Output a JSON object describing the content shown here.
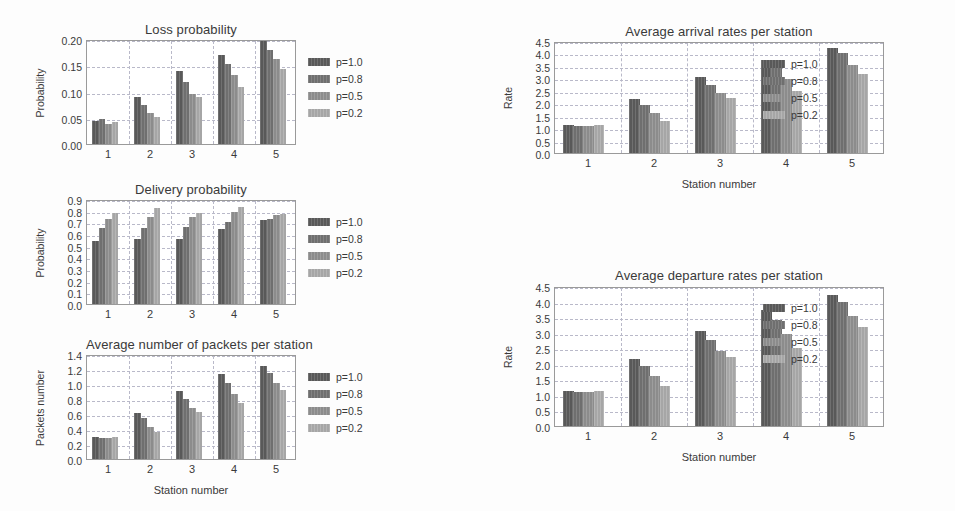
{
  "figure": {
    "series_labels": [
      "p=1.0",
      "p=0.8",
      "p=0.5",
      "p=0.2"
    ],
    "series_colors": [
      "#595959",
      "#6f6f6f",
      "#8c8c8c",
      "#a6a6a6"
    ],
    "background": "#ffffff",
    "grid_color": "#b9b9c9"
  },
  "chart_data": [
    {
      "id": "loss-probability",
      "type": "bar",
      "title": "Loss probability",
      "xlabel": "",
      "ylabel": "Probability",
      "categories": [
        "1",
        "2",
        "3",
        "4",
        "5"
      ],
      "ylim": [
        0.0,
        0.2
      ],
      "yticks": [
        0.0,
        0.05,
        0.1,
        0.15,
        0.2
      ],
      "ytick_labels": [
        "0.00",
        "0.05",
        "0.10",
        "0.15",
        "0.20"
      ],
      "grid": true,
      "legend_position": "right-outside-top",
      "series": [
        {
          "name": "p=1.0",
          "values": [
            0.043,
            0.089,
            0.139,
            0.17,
            0.197
          ]
        },
        {
          "name": "p=0.8",
          "values": [
            0.048,
            0.075,
            0.119,
            0.153,
            0.18
          ]
        },
        {
          "name": "p=0.5",
          "values": [
            0.038,
            0.06,
            0.096,
            0.131,
            0.161
          ]
        },
        {
          "name": "p=0.2",
          "values": [
            0.042,
            0.052,
            0.09,
            0.108,
            0.143
          ]
        }
      ]
    },
    {
      "id": "delivery-probability",
      "type": "bar",
      "title": "Delivery probability",
      "xlabel": "",
      "ylabel": "Probability",
      "categories": [
        "1",
        "2",
        "3",
        "4",
        "5"
      ],
      "ylim": [
        0.0,
        0.9
      ],
      "yticks": [
        0.0,
        0.1,
        0.2,
        0.3,
        0.4,
        0.5,
        0.6,
        0.7,
        0.8,
        0.9
      ],
      "ytick_labels": [
        "0.0",
        "0.1",
        "0.2",
        "0.3",
        "0.4",
        "0.5",
        "0.6",
        "0.7",
        "0.8",
        "0.9"
      ],
      "grid": true,
      "legend_position": "right-outside-top",
      "series": [
        {
          "name": "p=1.0",
          "values": [
            0.54,
            0.56,
            0.56,
            0.64,
            0.72
          ]
        },
        {
          "name": "p=0.8",
          "values": [
            0.65,
            0.65,
            0.66,
            0.7,
            0.73
          ]
        },
        {
          "name": "p=0.5",
          "values": [
            0.73,
            0.75,
            0.75,
            0.79,
            0.76
          ]
        },
        {
          "name": "p=0.2",
          "values": [
            0.78,
            0.82,
            0.78,
            0.83,
            0.77
          ]
        }
      ]
    },
    {
      "id": "average-packets-per-station",
      "type": "bar",
      "title": "Average number of packets per station",
      "xlabel": "Station number",
      "ylabel": "Packets number",
      "categories": [
        "1",
        "2",
        "3",
        "4",
        "5"
      ],
      "ylim": [
        0.0,
        1.4
      ],
      "yticks": [
        0.0,
        0.2,
        0.4,
        0.6,
        0.8,
        1.0,
        1.2,
        1.4
      ],
      "ytick_labels": [
        "0.0",
        "0.2",
        "0.4",
        "0.6",
        "0.8",
        "1.0",
        "1.2",
        "1.4"
      ],
      "grid": true,
      "legend_position": "right-outside-top",
      "series": [
        {
          "name": "p=1.0",
          "values": [
            0.29,
            0.62,
            0.91,
            1.13,
            1.24
          ]
        },
        {
          "name": "p=0.8",
          "values": [
            0.28,
            0.55,
            0.8,
            1.02,
            1.15
          ]
        },
        {
          "name": "p=0.5",
          "values": [
            0.28,
            0.43,
            0.68,
            0.87,
            1.02
          ]
        },
        {
          "name": "p=0.2",
          "values": [
            0.3,
            0.36,
            0.63,
            0.75,
            0.92
          ]
        }
      ]
    },
    {
      "id": "average-arrival-rates",
      "type": "bar",
      "title": "Average arrival rates per station",
      "xlabel": "Station number",
      "ylabel": "Rate",
      "categories": [
        "1",
        "2",
        "3",
        "4",
        "5"
      ],
      "ylim": [
        0.0,
        4.5
      ],
      "yticks": [
        0.0,
        0.5,
        1.0,
        1.5,
        2.0,
        2.5,
        3.0,
        3.5,
        4.0,
        4.5
      ],
      "ytick_labels": [
        "0.0",
        "0.5",
        "1.0",
        "1.5",
        "2.0",
        "2.5",
        "3.0",
        "3.5",
        "4.0",
        "4.5"
      ],
      "grid": true,
      "legend_position": "inside-right-top",
      "series": [
        {
          "name": "p=1.0",
          "values": [
            1.13,
            2.16,
            3.07,
            3.75,
            4.22
          ]
        },
        {
          "name": "p=0.8",
          "values": [
            1.09,
            1.93,
            2.74,
            3.41,
            4.02
          ]
        },
        {
          "name": "p=0.5",
          "values": [
            1.1,
            1.61,
            2.4,
            2.97,
            3.55
          ]
        },
        {
          "name": "p=0.2",
          "values": [
            1.12,
            1.3,
            2.21,
            2.51,
            3.19
          ]
        }
      ]
    },
    {
      "id": "average-departure-rates",
      "type": "bar",
      "title": "Average departure rates per station",
      "xlabel": "Station number",
      "ylabel": "Rate",
      "categories": [
        "1",
        "2",
        "3",
        "4",
        "5"
      ],
      "ylim": [
        0.0,
        4.5
      ],
      "yticks": [
        0.0,
        0.5,
        1.0,
        1.5,
        2.0,
        2.5,
        3.0,
        3.5,
        4.0,
        4.5
      ],
      "ytick_labels": [
        "0.0",
        "0.5",
        "1.0",
        "1.5",
        "2.0",
        "2.5",
        "3.0",
        "3.5",
        "4.0",
        "4.5"
      ],
      "grid": true,
      "legend_position": "inside-right-top",
      "series": [
        {
          "name": "p=1.0",
          "values": [
            1.12,
            2.16,
            3.07,
            3.74,
            4.2
          ]
        },
        {
          "name": "p=0.8",
          "values": [
            1.08,
            1.94,
            2.76,
            3.41,
            4.0
          ]
        },
        {
          "name": "p=0.5",
          "values": [
            1.1,
            1.62,
            2.4,
            2.96,
            3.53
          ]
        },
        {
          "name": "p=0.2",
          "values": [
            1.12,
            1.29,
            2.23,
            2.51,
            3.18
          ]
        }
      ]
    }
  ],
  "layout": {
    "panels": [
      {
        "id": "loss-probability",
        "plot": {
          "x": 86,
          "y": 40,
          "w": 210,
          "h": 105
        },
        "title_x": 86,
        "title_y": 22,
        "legend": {
          "x": 305,
          "y": 52,
          "w": 86,
          "h": 74
        }
      },
      {
        "id": "delivery-probability",
        "plot": {
          "x": 86,
          "y": 200,
          "w": 210,
          "h": 105
        },
        "title_x": 86,
        "title_y": 182,
        "legend": {
          "x": 305,
          "y": 212,
          "w": 86,
          "h": 74
        }
      },
      {
        "id": "average-packets-per-station",
        "plot": {
          "x": 86,
          "y": 355,
          "w": 210,
          "h": 105
        },
        "title_x": 86,
        "title_y": 337,
        "legend": {
          "x": 305,
          "y": 367,
          "w": 86,
          "h": 74
        }
      },
      {
        "id": "average-arrival-rates",
        "plot": {
          "x": 554,
          "y": 42,
          "w": 330,
          "h": 112
        },
        "title_x": 554,
        "title_y": 24,
        "legend": {
          "x": 760,
          "y": 54,
          "w": 100,
          "h": 78
        }
      },
      {
        "id": "average-departure-rates",
        "plot": {
          "x": 554,
          "y": 287,
          "w": 330,
          "h": 140
        },
        "title_x": 554,
        "title_y": 268,
        "legend": {
          "x": 760,
          "y": 298,
          "w": 100,
          "h": 80
        }
      }
    ]
  }
}
